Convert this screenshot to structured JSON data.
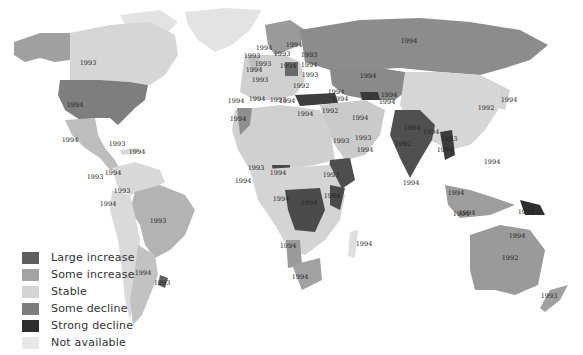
{
  "title": "",
  "colors": {
    "large_increase": "#5f5f5f",
    "some_increase": "#a3a3a3",
    "stable": "#d4d4d4",
    "some_decline": "#7d7d7d",
    "strong_decline": "#2e2e2e",
    "not_available": "#e8e8e8",
    "ocean": "#ffffff",
    "label": "#222222"
  },
  "legend": {
    "items": [
      {
        "label": "Large increase",
        "color": "#5f5f5f"
      },
      {
        "label": "Some increase",
        "color": "#a3a3a3"
      },
      {
        "label": "Stable",
        "color": "#d4d4d4"
      },
      {
        "label": "Some decline",
        "color": "#7d7d7d"
      },
      {
        "label": "Strong decline",
        "color": "#2e2e2e"
      },
      {
        "label": "Not available",
        "color": "#e8e8e8"
      }
    ]
  },
  "year_labels": [
    {
      "text": "1993",
      "x": 88,
      "y": 65
    },
    {
      "text": "1994",
      "x": 75,
      "y": 107
    },
    {
      "text": "1994",
      "x": 70,
      "y": 142
    },
    {
      "text": "1993",
      "x": 117,
      "y": 146
    },
    {
      "text": "1994",
      "x": 137,
      "y": 154
    },
    {
      "text": "1994",
      "x": 113,
      "y": 175
    },
    {
      "text": "1993",
      "x": 95,
      "y": 179
    },
    {
      "text": "1993",
      "x": 122,
      "y": 193
    },
    {
      "text": "1994",
      "x": 108,
      "y": 206
    },
    {
      "text": "1993",
      "x": 158,
      "y": 223
    },
    {
      "text": "1994",
      "x": 143,
      "y": 275
    },
    {
      "text": "1993",
      "x": 162,
      "y": 285
    },
    {
      "text": "1994",
      "x": 264,
      "y": 50
    },
    {
      "text": "1994",
      "x": 294,
      "y": 47
    },
    {
      "text": "1993",
      "x": 252,
      "y": 58
    },
    {
      "text": "1993",
      "x": 282,
      "y": 56
    },
    {
      "text": "1993",
      "x": 309,
      "y": 57
    },
    {
      "text": "1993",
      "x": 263,
      "y": 66
    },
    {
      "text": "1994",
      "x": 254,
      "y": 72
    },
    {
      "text": "1994",
      "x": 288,
      "y": 68
    },
    {
      "text": "1994",
      "x": 309,
      "y": 67
    },
    {
      "text": "1993",
      "x": 260,
      "y": 82
    },
    {
      "text": "1993",
      "x": 310,
      "y": 77
    },
    {
      "text": "1992",
      "x": 301,
      "y": 88
    },
    {
      "text": "1994",
      "x": 236,
      "y": 103
    },
    {
      "text": "1994",
      "x": 257,
      "y": 101
    },
    {
      "text": "1993",
      "x": 278,
      "y": 102
    },
    {
      "text": "1994",
      "x": 336,
      "y": 94
    },
    {
      "text": "1994",
      "x": 287,
      "y": 103
    },
    {
      "text": "1994",
      "x": 340,
      "y": 101
    },
    {
      "text": "1994",
      "x": 305,
      "y": 116
    },
    {
      "text": "1992",
      "x": 330,
      "y": 113
    },
    {
      "text": "1994",
      "x": 238,
      "y": 121
    },
    {
      "text": "1994",
      "x": 360,
      "y": 120
    },
    {
      "text": "1993",
      "x": 341,
      "y": 143
    },
    {
      "text": "1993",
      "x": 363,
      "y": 140
    },
    {
      "text": "1994",
      "x": 365,
      "y": 152
    },
    {
      "text": "1993",
      "x": 256,
      "y": 170
    },
    {
      "text": "1994",
      "x": 278,
      "y": 175
    },
    {
      "text": "1994",
      "x": 243,
      "y": 183
    },
    {
      "text": "1993",
      "x": 331,
      "y": 177
    },
    {
      "text": "1994",
      "x": 332,
      "y": 198
    },
    {
      "text": "1994",
      "x": 281,
      "y": 201
    },
    {
      "text": "1994",
      "x": 309,
      "y": 205
    },
    {
      "text": "1994",
      "x": 288,
      "y": 248
    },
    {
      "text": "1994",
      "x": 364,
      "y": 246
    },
    {
      "text": "1994",
      "x": 300,
      "y": 279
    },
    {
      "text": "1994",
      "x": 409,
      "y": 43
    },
    {
      "text": "1994",
      "x": 368,
      "y": 78
    },
    {
      "text": "1994",
      "x": 389,
      "y": 97
    },
    {
      "text": "1994",
      "x": 387,
      "y": 104
    },
    {
      "text": "1994",
      "x": 412,
      "y": 130
    },
    {
      "text": "1994",
      "x": 431,
      "y": 134
    },
    {
      "text": "1992",
      "x": 403,
      "y": 146
    },
    {
      "text": "1993",
      "x": 449,
      "y": 141
    },
    {
      "text": "1994",
      "x": 445,
      "y": 152
    },
    {
      "text": "1994",
      "x": 411,
      "y": 185
    },
    {
      "text": "1992",
      "x": 486,
      "y": 110
    },
    {
      "text": "1994",
      "x": 509,
      "y": 102
    },
    {
      "text": "1994",
      "x": 492,
      "y": 164
    },
    {
      "text": "1994",
      "x": 456,
      "y": 195
    },
    {
      "text": "1994",
      "x": 461,
      "y": 216
    },
    {
      "text": "1994",
      "x": 467,
      "y": 215
    },
    {
      "text": "1994",
      "x": 526,
      "y": 214
    },
    {
      "text": "1994",
      "x": 517,
      "y": 238
    },
    {
      "text": "1992",
      "x": 510,
      "y": 260
    },
    {
      "text": "1993",
      "x": 549,
      "y": 298
    }
  ]
}
